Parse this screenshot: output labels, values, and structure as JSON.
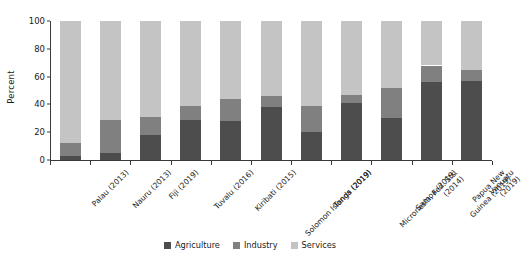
{
  "chart_data": {
    "type": "bar",
    "stacked": true,
    "title": "",
    "xlabel": "",
    "ylabel": "Percent",
    "ylim": [
      0,
      100
    ],
    "yticks": [
      0,
      20,
      40,
      60,
      80,
      100
    ],
    "grid": false,
    "legend_position": "bottom",
    "categories": [
      "Palau (2013)",
      "Nauru (2013)",
      "Fiji (2019)",
      "Tuvalu (2016)",
      "Kiribati (2015)",
      "Solomon Islands (2019)",
      "Tonga (2019)",
      "Micronesia, Fed. Sts. (2014)",
      "Samoa (2019)",
      "Papua New Guinea (2019)",
      "Vanuatu (2019)"
    ],
    "series": [
      {
        "name": "Agriculture",
        "color": "#4d4d4d",
        "values": [
          3,
          5,
          18,
          29,
          28,
          38,
          20,
          41,
          30,
          56,
          57
        ]
      },
      {
        "name": "Industry",
        "color": "#808080",
        "values": [
          9,
          24,
          13,
          10,
          16,
          8,
          19,
          6,
          22,
          12,
          8
        ]
      },
      {
        "name": "Services",
        "color": "#c4c4c4",
        "values": [
          88,
          71,
          69,
          61,
          56,
          54,
          61,
          53,
          48,
          32,
          35
        ]
      }
    ]
  },
  "legend": {
    "items": [
      {
        "label": "Agriculture",
        "color": "#4d4d4d"
      },
      {
        "label": "Industry",
        "color": "#808080"
      },
      {
        "label": "Services",
        "color": "#c4c4c4"
      }
    ]
  }
}
